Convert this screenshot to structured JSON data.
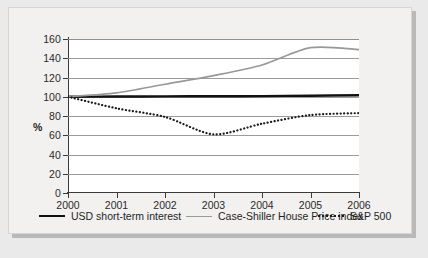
{
  "chart_data": {
    "type": "line",
    "title": "",
    "xlabel": "",
    "ylabel": "%",
    "x": [
      2000,
      2001,
      2002,
      2003,
      2004,
      2005,
      2006
    ],
    "xtick_labels": [
      "2000",
      "2001",
      "2002",
      "2003",
      "2004",
      "2005",
      "2006"
    ],
    "ytick_labels": [
      "160",
      "140",
      "120",
      "100",
      "80",
      "60",
      "40",
      "20",
      "0"
    ],
    "ytick_values": [
      160,
      140,
      120,
      100,
      80,
      60,
      40,
      20,
      0
    ],
    "ylim": [
      0,
      160
    ],
    "xlim": [
      2000,
      2006
    ],
    "grid": true,
    "legend_position": "bottom",
    "series": [
      {
        "name": "USD short-term interest",
        "style": "solid",
        "color": "#111111",
        "width": 2.4,
        "values": [
          100,
          100.2,
          100.4,
          100.5,
          100.7,
          101.1,
          101.6
        ]
      },
      {
        "name": "Case-Shiller House Price index",
        "style": "solid",
        "color": "#999999",
        "width": 1.7,
        "values": [
          100,
          104,
          113,
          122,
          133,
          151,
          149
        ]
      },
      {
        "name": "S&P 500",
        "style": "dotted",
        "color": "#1a1a1a",
        "width": 2.2,
        "values": [
          100,
          88,
          79,
          61,
          72,
          81,
          83
        ]
      }
    ]
  },
  "legend": {
    "items": [
      {
        "label": "USD short-term interest",
        "swatch": "solid-black"
      },
      {
        "label": "Case-Shiller House Price index",
        "swatch": "solid-gray"
      },
      {
        "label": "S&P 500",
        "swatch": "dotted"
      }
    ]
  },
  "colors": {
    "page_background": "#eaeaea",
    "card_background": "#f2f1f0",
    "card_border": "#d8d6d4",
    "plot_background": "#ffffff",
    "gridline": "#9b9b9b",
    "axis": "#3a3a3a",
    "text": "#1f1f1f"
  }
}
